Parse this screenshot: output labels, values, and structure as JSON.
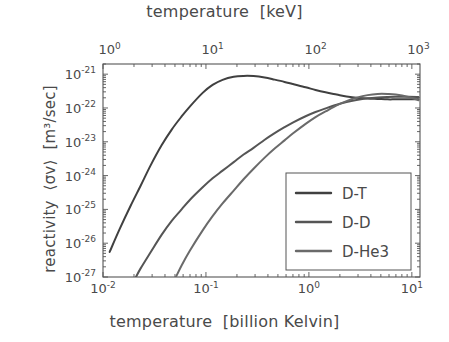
{
  "figure": {
    "background_color": "#ffffff",
    "frame_color": "#555555",
    "text_color": "#4a4a4a"
  },
  "chart_data": {
    "type": "line",
    "title": "",
    "xlabel": "temperature  [billion Kelvin]",
    "xlabel_top": "temperature  [keV]",
    "ylabel": "reactivity  ⟨σv⟩  [m³/sec]",
    "xscale": "log",
    "yscale": "log",
    "xlim": [
      0.01,
      12
    ],
    "ylim": [
      1e-27,
      2e-21
    ],
    "xlim_top_keV": [
      0.8618,
      1034.2
    ],
    "grid": false,
    "legend_position": "lower right",
    "xticks": [
      0.01,
      0.1,
      1,
      10
    ],
    "xtick_labels": [
      "10⁻²",
      "10⁻¹",
      "10⁰",
      "10¹"
    ],
    "xticks_top_keV": [
      1,
      10,
      100,
      1000
    ],
    "xtick_labels_top": [
      "10⁰",
      "10¹",
      "10²",
      "10³"
    ],
    "yticks": [
      1e-21,
      1e-22,
      1e-23,
      1e-24,
      1e-25,
      1e-26,
      1e-27
    ],
    "ytick_labels": [
      "10⁻²¹",
      "10⁻²²",
      "10⁻²³",
      "10⁻²⁴",
      "10⁻²⁵",
      "10⁻²⁶",
      "10⁻²⁷"
    ],
    "ytick_mantissa": [
      "10",
      "10",
      "10",
      "10",
      "10",
      "10",
      "10"
    ],
    "ytick_exponent": [
      "-21",
      "-22",
      "-23",
      "-24",
      "-25",
      "-26",
      "-27"
    ],
    "xtick_mantissa": [
      "10",
      "10",
      "10",
      "10"
    ],
    "xtick_exponent": [
      "-2",
      "-1",
      "0",
      "1"
    ],
    "xtick_top_mantissa": [
      "10",
      "10",
      "10",
      "10"
    ],
    "xtick_top_exponent": [
      "0",
      "1",
      "2",
      "3"
    ],
    "series": [
      {
        "name": "D-T",
        "color": "#404040",
        "x": [
          0.0116,
          0.0145,
          0.0186,
          0.0232,
          0.029,
          0.0372,
          0.0465,
          0.058,
          0.0697,
          0.0929,
          0.116,
          0.145,
          0.186,
          0.232,
          0.29,
          0.372,
          0.465,
          0.58,
          0.697,
          0.929,
          1.16,
          1.45,
          1.86,
          2.32,
          2.9,
          3.72,
          4.65,
          5.8,
          6.97,
          9.29,
          11.6
        ],
        "y": [
          5.5e-27,
          2.6e-26,
          1.3e-25,
          5e-25,
          2e-24,
          8e-24,
          2.3e-23,
          5.6e-23,
          1.1e-22,
          2.8e-22,
          4.8e-22,
          6.8e-22,
          8.4e-22,
          8.9e-22,
          8.8e-22,
          8e-22,
          6.9e-22,
          5.9e-22,
          5.1e-22,
          4.1e-22,
          3.4e-22,
          2.9e-22,
          2.5e-22,
          2.2e-22,
          2e-22,
          1.9e-22,
          1.85e-22,
          1.8e-22,
          1.8e-22,
          1.8e-22,
          1.8e-22
        ],
        "legend_label": "D-T"
      },
      {
        "name": "D-D",
        "color": "#555555",
        "x": [
          0.0209,
          0.0232,
          0.029,
          0.0372,
          0.0465,
          0.058,
          0.0697,
          0.0929,
          0.116,
          0.145,
          0.186,
          0.232,
          0.29,
          0.372,
          0.465,
          0.58,
          0.697,
          0.929,
          1.16,
          1.45,
          1.86,
          2.32,
          2.9,
          3.72,
          4.65,
          5.8,
          6.97,
          9.29,
          11.6
        ],
        "y": [
          1e-27,
          1.8e-27,
          5.4e-27,
          1.8e-26,
          4.6e-26,
          1e-25,
          1.9e-25,
          4.5e-25,
          8.3e-25,
          1.4e-24,
          2.5e-24,
          4.2e-24,
          6.6e-24,
          1.15e-23,
          1.8e-23,
          2.7e-23,
          3.7e-23,
          5.7e-23,
          7.6e-23,
          9.7e-23,
          1.25e-22,
          1.5e-22,
          1.72e-22,
          1.93e-22,
          2.05e-22,
          2.12e-22,
          2.15e-22,
          2.14e-22,
          2.1e-22
        ],
        "legend_label": "D-D"
      },
      {
        "name": "D-He3",
        "color": "#6a6a6a",
        "x": [
          0.0511,
          0.058,
          0.0697,
          0.0929,
          0.116,
          0.145,
          0.186,
          0.232,
          0.29,
          0.372,
          0.465,
          0.58,
          0.697,
          0.929,
          1.16,
          1.45,
          1.86,
          2.32,
          2.9,
          3.72,
          4.65,
          5.8,
          6.97,
          9.29,
          11.6
        ],
        "y": [
          1e-27,
          2.2e-27,
          6e-27,
          2.4e-26,
          6.3e-26,
          1.5e-25,
          3.6e-25,
          7.8e-25,
          1.6e-24,
          3.4e-24,
          6.3e-24,
          1.1e-23,
          1.75e-23,
          3.4e-23,
          5.4e-23,
          7.9e-23,
          1.2e-22,
          1.6e-22,
          2e-22,
          2.4e-22,
          2.6e-22,
          2.6e-22,
          2.5e-22,
          2.1e-22,
          1.7e-22
        ],
        "legend_label": "D-He3"
      }
    ]
  },
  "legend": {
    "entries": [
      {
        "label": "D-T"
      },
      {
        "label": "D-D"
      },
      {
        "label": "D-He3"
      }
    ]
  }
}
